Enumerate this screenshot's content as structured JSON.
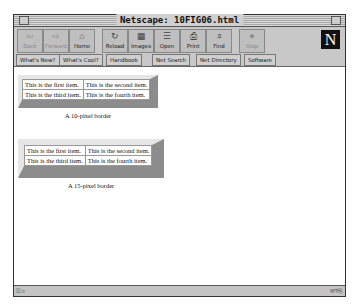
{
  "window": {
    "title": "Netscape: 10FIG06.html"
  },
  "toolbar": {
    "buttons": [
      {
        "label": "Back",
        "icon": "⇦",
        "enabled": false
      },
      {
        "label": "Forward",
        "icon": "⇨",
        "enabled": false
      },
      {
        "label": "Home",
        "icon": "⌂",
        "enabled": true
      },
      {
        "label": "Reload",
        "icon": "↻",
        "enabled": true
      },
      {
        "label": "Images",
        "icon": "▦",
        "enabled": true
      },
      {
        "label": "Open",
        "icon": "☰",
        "enabled": true
      },
      {
        "label": "Print",
        "icon": "⎙",
        "enabled": true
      },
      {
        "label": "Find",
        "icon": "⌕",
        "enabled": true
      },
      {
        "label": "Stop",
        "icon": "●",
        "enabled": false
      }
    ],
    "logo": "N"
  },
  "directory": {
    "buttons": [
      "What's New?",
      "What's Cool?",
      "Handbook",
      "Net Search",
      "Net Directory",
      "Software"
    ]
  },
  "content": {
    "tables": [
      {
        "rows": [
          [
            "This is the first item.",
            "This is the second item."
          ],
          [
            "This is the third item.",
            "This is the fourth item."
          ]
        ],
        "caption": "A 10-pixel border"
      },
      {
        "rows": [
          [
            "This is the first item.",
            "This is the second item."
          ],
          [
            "This is the third item.",
            "This is the fourth item."
          ]
        ],
        "caption": "A 15-pixel border"
      }
    ]
  },
  "status": {
    "security": "⚿✉",
    "right_icons": "✉?⎘"
  }
}
